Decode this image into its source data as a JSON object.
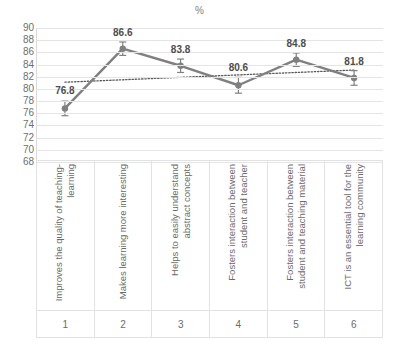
{
  "chart_data": {
    "type": "line",
    "title": "%",
    "xlabel": "",
    "ylabel": "",
    "ylim": [
      68,
      90
    ],
    "ystep": 2,
    "grid": true,
    "legend": "none",
    "yticks": [
      "90",
      "88",
      "86",
      "84",
      "82",
      "80",
      "78",
      "76",
      "74",
      "72",
      "70",
      "68"
    ],
    "categories": [
      "Improves the quality of teaching-learning",
      "Makes learning more interesting",
      "Helps to easily understand abstract concepts",
      "Fosters interaction between student and teacher",
      "Fosters interaction between student and teaching material",
      "ICT is an essential tool for the learning community"
    ],
    "category_numbers": [
      "1",
      "2",
      "3",
      "4",
      "5",
      "6"
    ],
    "values": [
      76.8,
      86.6,
      83.8,
      80.6,
      84.8,
      81.8
    ],
    "data_labels": [
      "76.8",
      "86.6",
      "83.8",
      "80.6",
      "84.8",
      "81.8"
    ],
    "error_bars": [
      1.2,
      1.1,
      1.1,
      1.3,
      1.1,
      1.2
    ],
    "trendline": {
      "type": "linear-dotted",
      "start_value": 81.1,
      "end_value": 83.1
    },
    "colors": {
      "series": "#808080",
      "trendline": "#595959",
      "gridline": "#e4e4e4",
      "label_text": "#4d4d4d",
      "axis_text": "#6a6a6a",
      "title_text": "#7f7f7f",
      "background": "#ffffff"
    }
  }
}
